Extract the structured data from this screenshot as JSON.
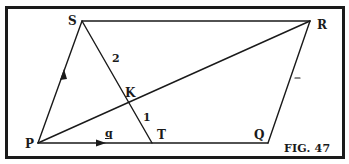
{
  "figure": {
    "caption": "FIG. 47",
    "points": {
      "S": {
        "label": "S",
        "x": 82,
        "y": 21
      },
      "R": {
        "label": "R",
        "x": 310,
        "y": 21
      },
      "P": {
        "label": "P",
        "x": 38,
        "y": 143
      },
      "T": {
        "label": "T",
        "x": 152,
        "y": 143
      },
      "Q": {
        "label": "Q",
        "x": 268,
        "y": 143
      },
      "K": {
        "label": "K",
        "x": 128,
        "y": 104
      }
    },
    "segments": [
      {
        "from": "P",
        "to": "S",
        "arrow": true
      },
      {
        "from": "S",
        "to": "R",
        "arrow": false
      },
      {
        "from": "R",
        "to": "Q",
        "arrow": false
      },
      {
        "from": "P",
        "to": "Q",
        "arrow": true
      },
      {
        "from": "P",
        "to": "R",
        "arrow": false
      },
      {
        "from": "S",
        "to": "T",
        "arrow": false
      }
    ],
    "annotations": {
      "ratio_SK": "2",
      "ratio_KT": "1",
      "vector_PT": "q",
      "tick_mark_QR": "-"
    },
    "colors": {
      "ink": "#1a1a1a",
      "background": "#ffffff"
    }
  }
}
